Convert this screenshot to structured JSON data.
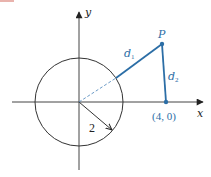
{
  "diagram": {
    "axes": {
      "x_label": "x",
      "y_label": "y"
    },
    "circle": {
      "radius_label": "2"
    },
    "point_p": {
      "label": "P"
    },
    "point_a": {
      "label": "(4, 0)"
    },
    "segments": {
      "d1": {
        "label_main": "d",
        "label_sub": "1"
      },
      "d2": {
        "label_main": "d",
        "label_sub": "2"
      }
    },
    "colors": {
      "axis": "#333333",
      "circle": "#333333",
      "accent": "#2c6ea6",
      "top_fragment": "#c0392b"
    }
  }
}
